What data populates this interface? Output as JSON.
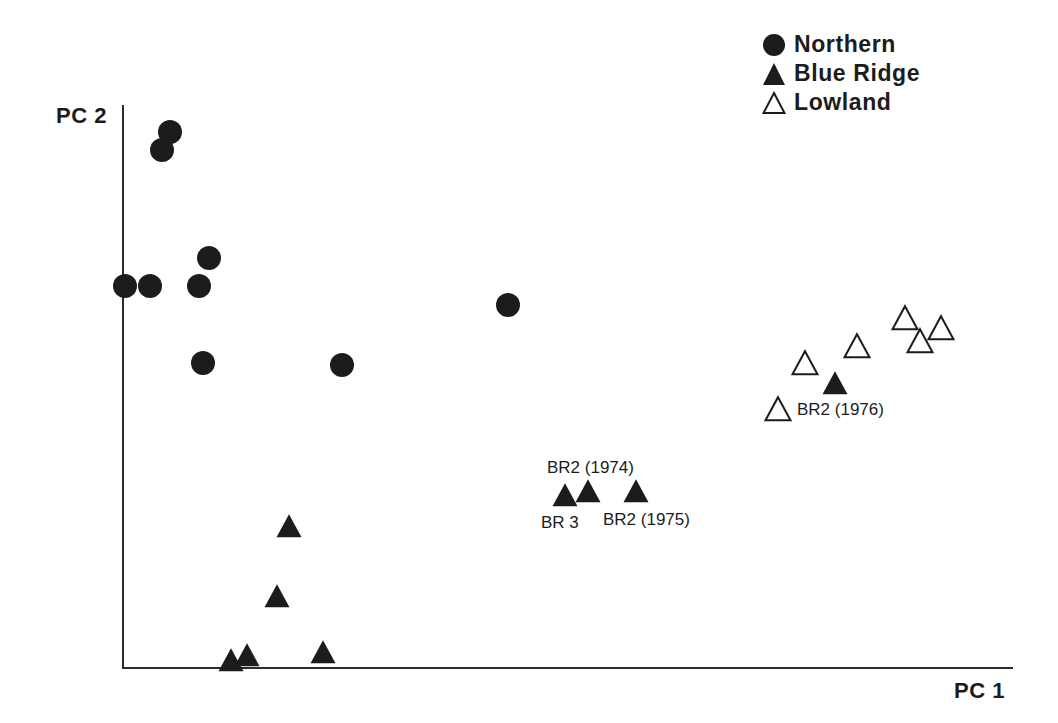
{
  "chart_data": {
    "type": "scatter",
    "title": "",
    "xlabel": "PC 1",
    "ylabel": "PC 2",
    "grid": false,
    "legend_position": "top-right",
    "axes_pixel": {
      "x0": 123,
      "y0": 668,
      "x1": 1013,
      "y1": 105
    },
    "legend": [
      {
        "name": "Northern",
        "marker": "filled-circle"
      },
      {
        "name": "Blue Ridge",
        "marker": "filled-triangle"
      },
      {
        "name": "Lowland",
        "marker": "open-triangle"
      }
    ],
    "series": [
      {
        "name": "Northern",
        "marker": "filled-circle",
        "points_px": [
          [
            170,
            132
          ],
          [
            162,
            150
          ],
          [
            209,
            258
          ],
          [
            125,
            286
          ],
          [
            150,
            286
          ],
          [
            199,
            286
          ],
          [
            203,
            363
          ],
          [
            342,
            365
          ],
          [
            508,
            305
          ]
        ]
      },
      {
        "name": "Blue Ridge",
        "marker": "filled-triangle",
        "points_px": [
          [
            289,
            528
          ],
          [
            277,
            598
          ],
          [
            231,
            662
          ],
          [
            247,
            657
          ],
          [
            323,
            654
          ],
          [
            565,
            497
          ],
          [
            588,
            493
          ],
          [
            636,
            493
          ],
          [
            835,
            385
          ]
        ]
      },
      {
        "name": "Lowland",
        "marker": "open-triangle",
        "points_px": [
          [
            805,
            365
          ],
          [
            857,
            348
          ],
          [
            905,
            320
          ],
          [
            920,
            343
          ],
          [
            941,
            330
          ],
          [
            778,
            411
          ]
        ]
      }
    ],
    "annotations": [
      {
        "text": "BR2 (1974)",
        "x": 547,
        "y": 458
      },
      {
        "text": "BR 3",
        "x": 541,
        "y": 513
      },
      {
        "text": "BR2 (1975)",
        "x": 603,
        "y": 510
      },
      {
        "text": "BR2 (1976)",
        "x": 797,
        "y": 400
      }
    ]
  },
  "labels": {
    "xaxis": "PC 1",
    "yaxis": "PC 2",
    "legend": [
      "Northern",
      "Blue Ridge",
      "Lowland"
    ],
    "annotations": [
      "BR2 (1974)",
      "BR 3",
      "BR2 (1975)",
      "BR2 (1976)"
    ]
  },
  "colors": {
    "ink": "#1c1c1c",
    "background": "#ffffff"
  }
}
